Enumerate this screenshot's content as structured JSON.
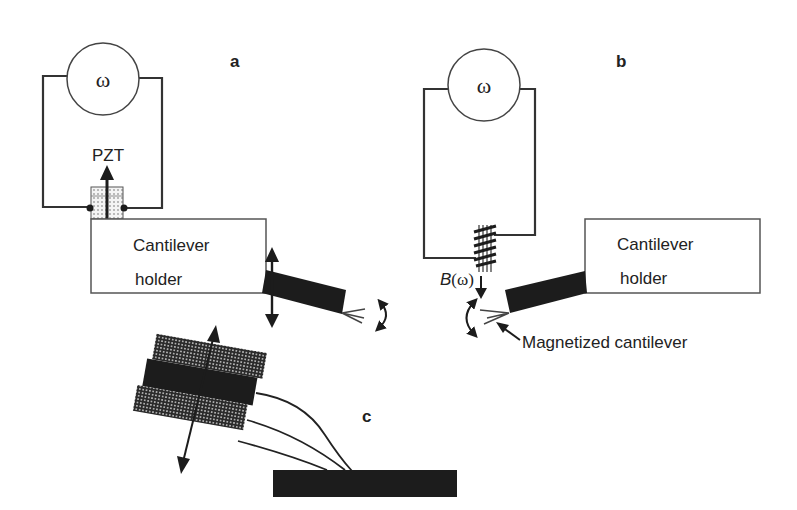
{
  "figure": {
    "panels": {
      "a": {
        "label": "a",
        "source_symbol": "ω",
        "actuator_label": "PZT",
        "holder_line1": "Cantilever",
        "holder_line2": "holder"
      },
      "b": {
        "label": "b",
        "source_symbol": "ω",
        "field_label_prefix": "B",
        "field_label_arg": "(ω)",
        "holder_line1": "Cantilever",
        "holder_line2": "holder",
        "cantilever_label": "Magnetized cantilever"
      },
      "c": {
        "label": "c"
      }
    },
    "colors": {
      "ink": "#1c1c1c",
      "line": "#333333",
      "background": "#ffffff"
    }
  }
}
